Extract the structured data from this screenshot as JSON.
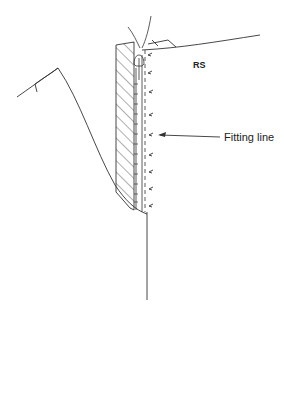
{
  "diagram": {
    "type": "sewing-technical-illustration",
    "labels": {
      "side": "RS",
      "fitting_line": "Fitting line"
    },
    "colors": {
      "ink": "#222222",
      "background": "#ffffff"
    },
    "elements": [
      {
        "name": "garment-panel-left",
        "kind": "curved outline"
      },
      {
        "name": "facing-hatched",
        "kind": "hatched strip"
      },
      {
        "name": "zipper",
        "kind": "zipper teeth with pull tab"
      },
      {
        "name": "stitch-line",
        "kind": "dashed line"
      },
      {
        "name": "fitting-arrows",
        "kind": "small arrows",
        "count": 9
      },
      {
        "name": "fitting-line-callout",
        "kind": "arrow with label"
      },
      {
        "name": "seam-line",
        "kind": "vertical line"
      }
    ]
  }
}
